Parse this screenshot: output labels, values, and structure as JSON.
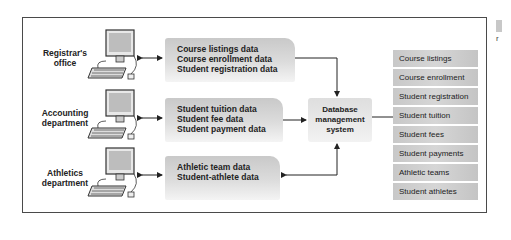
{
  "diagram": {
    "departments": [
      {
        "label_line1": "Registrar's",
        "label_line2": "office",
        "data": [
          "Course listings data",
          "Course enrollment data",
          "Student registration data"
        ]
      },
      {
        "label_line1": "Accounting",
        "label_line2": "department",
        "data": [
          "Student tuition data",
          "Student fee data",
          "Student payment data"
        ]
      },
      {
        "label_line1": "Athletics",
        "label_line2": "department",
        "data": [
          "Athletic team data",
          "Student-athlete data"
        ]
      }
    ],
    "dbms": {
      "line1": "Database",
      "line2": "management",
      "line3": "system"
    },
    "database_tables": [
      "Course listings",
      "Course enrollment",
      "Student registration",
      "Student tuition",
      "Student fees",
      "Student payments",
      "Athletic teams",
      "Student athletes"
    ],
    "side_text": "r"
  }
}
